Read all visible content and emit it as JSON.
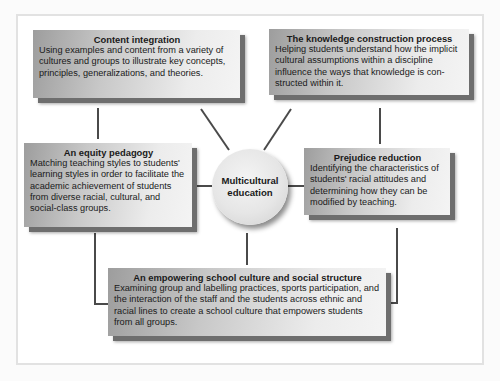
{
  "diagram": {
    "center": {
      "line1": "Multicultural",
      "line2": "education"
    },
    "dimensions": [
      {
        "id": "content-integration",
        "title": "Content integration",
        "description": "Using examples and content from a variety of cultures and groups to illustrate key concepts, principles, generalizations, and theories."
      },
      {
        "id": "knowledge-construction",
        "title": "The knowledge construction process",
        "description": "Helping students understand how the implicit cultural assumptions within a discipline influence the ways that knowledge is con-structed within it."
      },
      {
        "id": "equity-pedagogy",
        "title": "An equity pedagogy",
        "description": "Matching teaching styles to students' learning styles in order to facilitate the academic achievement of students from diverse racial, cultural, and social-class groups."
      },
      {
        "id": "prejudice-reduction",
        "title": "Prejudice reduction",
        "description": "Identifying the characteristics of students' racial attitudes and determining how they can be modified by teaching."
      },
      {
        "id": "empowering-school-culture",
        "title": "An empowering school culture and social structure",
        "description": "Examining group and labelling practices, sports participation, and the interaction of the staff and the students across ethnic and racial lines to create a school culture that empowers students from all groups."
      }
    ],
    "colors": {
      "connector": "#4a4a4a",
      "box_shadow": "#6e6e6e",
      "frame_border": "#e2e2e2"
    }
  }
}
